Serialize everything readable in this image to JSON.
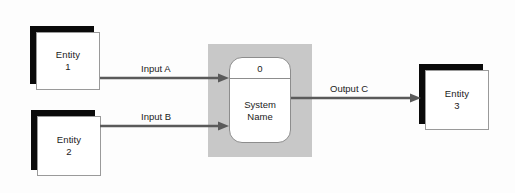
{
  "diagram": {
    "type": "context-data-flow-diagram",
    "background_color": "#fdfdfd",
    "shadow_color": "#0a0a0a",
    "backdrop_color": "#c8c8c8",
    "line_color": "#5a5a5a",
    "entities": [
      {
        "id": "entity-1",
        "line1": "Entity",
        "line2": "1"
      },
      {
        "id": "entity-2",
        "line1": "Entity",
        "line2": "2"
      },
      {
        "id": "entity-3",
        "line1": "Entity",
        "line2": "3"
      }
    ],
    "process": {
      "id": "0",
      "name_line1": "System",
      "name_line2": "Name"
    },
    "flows": [
      {
        "id": "flow-input-a",
        "label": "Input A"
      },
      {
        "id": "flow-input-b",
        "label": "Input B"
      },
      {
        "id": "flow-output-c",
        "label": "Output C"
      }
    ]
  }
}
